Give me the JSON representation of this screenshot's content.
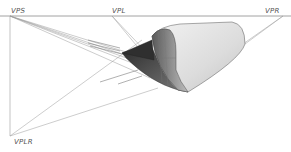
{
  "diagram": {
    "type": "perspective-drawing",
    "vanishing_points": [
      {
        "id": "vps",
        "label": "VPS",
        "x": 10,
        "y": 16
      },
      {
        "id": "vpl",
        "label": "VPL",
        "x": 112,
        "y": 16
      },
      {
        "id": "vpr",
        "label": "VPR",
        "x": 283,
        "y": 16
      },
      {
        "id": "vplr",
        "label": "VPLR",
        "x": 10,
        "y": 136
      }
    ],
    "horizon_line": {
      "y": 16,
      "x1": 0,
      "x2": 291
    },
    "colors": {
      "line": "#9a9a9a",
      "horizon": "#8a8a8a",
      "surface_light": "#e8e8e8",
      "surface_mid": "#b5b5b5",
      "surface_dark": "#3a3a3a",
      "label": "#555555"
    }
  }
}
